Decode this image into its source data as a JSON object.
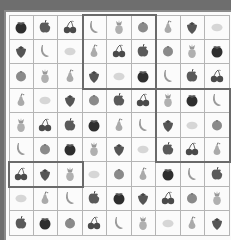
{
  "game": {
    "type": "fruit-sudoku",
    "size": 9,
    "legend": {
      "A": "apple",
      "M": "mangosteen",
      "C": "cherries",
      "S": "strawberry",
      "B": "banana",
      "P": "pineapple",
      "O": "orange",
      "R": "pear",
      "L": "lemon"
    },
    "grid": [
      [
        "M",
        "A",
        "C",
        "B",
        "P",
        "O",
        "R",
        "S",
        "L"
      ],
      [
        "S",
        "B",
        "L",
        "R",
        "C",
        "A",
        "O",
        "P",
        "M"
      ],
      [
        "O",
        "P",
        "R",
        "S",
        "L",
        "M",
        "B",
        "A",
        "C"
      ],
      [
        "R",
        "L",
        "S",
        "O",
        "A",
        "C",
        "P",
        "M",
        "B"
      ],
      [
        "P",
        "C",
        "A",
        "M",
        "R",
        "B",
        "S",
        "L",
        "O"
      ],
      [
        "B",
        "O",
        "M",
        "P",
        "S",
        "L",
        "A",
        "C",
        "R"
      ],
      [
        "C",
        "S",
        "P",
        "L",
        "O",
        "R",
        "M",
        "B",
        "A"
      ],
      [
        "L",
        "R",
        "B",
        "A",
        "M",
        "S",
        "C",
        "O",
        "P"
      ],
      [
        "A",
        "M",
        "O",
        "C",
        "B",
        "P",
        "L",
        "R",
        "S"
      ]
    ],
    "highlights": [
      {
        "row": 0,
        "col": 3,
        "rows": 3,
        "cols": 3
      },
      {
        "row": 3,
        "col": 6,
        "rows": 3,
        "cols": 3
      },
      {
        "row": 6,
        "col": 0,
        "rows": 1,
        "cols": 3
      }
    ],
    "colors": {
      "mangosteen": "#2e2e2e",
      "apple": "#5a5a5a",
      "cherries": "#4a4a4a",
      "strawberry": "#555555",
      "banana": "#9a9a9a",
      "pineapple": "#b0b0b0",
      "orange": "#8a8a8a",
      "pear": "#aaaaaa",
      "lemon": "#d6d6d6"
    }
  }
}
